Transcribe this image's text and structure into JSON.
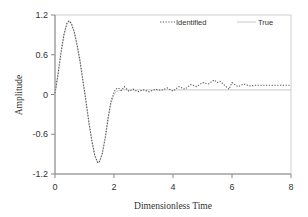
{
  "chart_data": {
    "type": "line",
    "title": "",
    "xlabel": "Dimensionless Time",
    "ylabel": "Amplitude",
    "xlim": [
      0,
      8
    ],
    "ylim": [
      -1.2,
      1.2
    ],
    "xticks": [
      0,
      2,
      4,
      6,
      8
    ],
    "xtick_labels": [
      "0",
      "2",
      "4",
      "6",
      "8"
    ],
    "yticks": [
      1.2,
      0.6,
      0,
      -0.6,
      -1.2
    ],
    "ytick_labels": [
      "1.2",
      "0.6",
      "0",
      "-0.6",
      "-1.2"
    ],
    "grid": false,
    "legend": {
      "position": "top-right inside",
      "entries": [
        {
          "label": "Identified",
          "style": "dotted",
          "color": "#555555"
        },
        {
          "label": "True",
          "style": "solid",
          "color": "#c8c8c8"
        }
      ]
    },
    "series": [
      {
        "name": "Identified",
        "style": "dotted",
        "color": "#555555",
        "x": [
          0,
          0.1,
          0.2,
          0.3,
          0.4,
          0.47,
          0.55,
          0.65,
          0.75,
          0.85,
          0.95,
          1.05,
          1.15,
          1.25,
          1.35,
          1.45,
          1.5,
          1.6,
          1.7,
          1.8,
          1.9,
          2.0,
          2.05,
          2.15,
          2.25,
          2.35,
          2.5,
          2.65,
          2.8,
          3.0,
          3.2,
          3.4,
          3.6,
          3.8,
          4.0,
          4.2,
          4.4,
          4.6,
          4.8,
          5.0,
          5.2,
          5.4,
          5.5,
          5.6,
          5.8,
          5.9,
          6.0,
          6.2,
          6.4,
          6.6,
          6.8,
          7.0,
          7.5,
          8.0
        ],
        "y": [
          0.02,
          0.3,
          0.62,
          0.9,
          1.07,
          1.11,
          1.08,
          0.95,
          0.75,
          0.5,
          0.2,
          -0.1,
          -0.42,
          -0.7,
          -0.92,
          -1.03,
          -1.02,
          -0.9,
          -0.65,
          -0.35,
          -0.1,
          0.03,
          0.08,
          0.1,
          0.06,
          0.12,
          0.05,
          0.08,
          0.04,
          0.07,
          0.04,
          0.08,
          0.06,
          0.1,
          0.05,
          0.12,
          0.08,
          0.15,
          0.12,
          0.18,
          0.16,
          0.22,
          0.18,
          0.2,
          0.12,
          0.08,
          0.18,
          0.12,
          0.16,
          0.13,
          0.14,
          0.14,
          0.14,
          0.14
        ]
      },
      {
        "name": "True",
        "style": "solid",
        "color": "#c8c8c8",
        "x": [
          0,
          0.1,
          0.2,
          0.3,
          0.4,
          0.47,
          0.55,
          0.65,
          0.75,
          0.85,
          0.95,
          1.05,
          1.15,
          1.25,
          1.35,
          1.45,
          1.5,
          1.6,
          1.7,
          1.8,
          1.9,
          2.0,
          2.1,
          2.3,
          2.6,
          3.0,
          4.0,
          5.0,
          6.0,
          7.0,
          8.0
        ],
        "y": [
          0.0,
          0.3,
          0.62,
          0.9,
          1.06,
          1.1,
          1.07,
          0.94,
          0.74,
          0.49,
          0.19,
          -0.11,
          -0.43,
          -0.71,
          -0.93,
          -1.03,
          -1.02,
          -0.9,
          -0.66,
          -0.37,
          -0.13,
          0.0,
          0.05,
          0.07,
          0.07,
          0.07,
          0.07,
          0.07,
          0.07,
          0.07,
          0.07
        ]
      }
    ]
  }
}
